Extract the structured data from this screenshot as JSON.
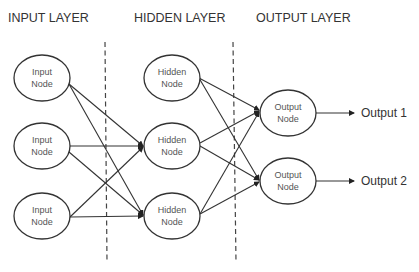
{
  "diagram": {
    "layers": [
      {
        "id": "input",
        "title": "INPUT LAYER",
        "title_x": 8,
        "nodes": [
          {
            "label_line1": "Input",
            "label_line2": "Node",
            "cx": 42,
            "cy": 78
          },
          {
            "label_line1": "Input",
            "label_line2": "Node",
            "cx": 42,
            "cy": 146
          },
          {
            "label_line1": "Input",
            "label_line2": "Node",
            "cx": 42,
            "cy": 216
          }
        ]
      },
      {
        "id": "hidden",
        "title": "HIDDEN LAYER",
        "title_x": 134,
        "nodes": [
          {
            "label_line1": "Hidden",
            "label_line2": "Node",
            "cx": 172,
            "cy": 78
          },
          {
            "label_line1": "Hidden",
            "label_line2": "Node",
            "cx": 172,
            "cy": 146
          },
          {
            "label_line1": "Hidden",
            "label_line2": "Node",
            "cx": 172,
            "cy": 216
          }
        ]
      },
      {
        "id": "output",
        "title": "OUTPUT LAYER",
        "title_x": 256,
        "nodes": [
          {
            "label_line1": "Output",
            "label_line2": "Node",
            "cx": 288,
            "cy": 113
          },
          {
            "label_line1": "Output",
            "label_line2": "Node",
            "cx": 288,
            "cy": 181
          }
        ]
      }
    ],
    "outputs": [
      {
        "label": "Output 1"
      },
      {
        "label": "Output 2"
      }
    ],
    "connections": {
      "input_to_hidden": "each input node connects to hidden nodes 2 and 3",
      "hidden_to_output": "each hidden node connects to both output nodes"
    },
    "colors": {
      "stroke": "#333333",
      "text": "#333333",
      "background": "#ffffff"
    }
  }
}
